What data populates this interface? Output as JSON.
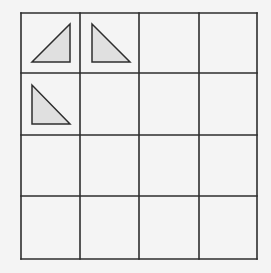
{
  "diagram": {
    "type": "grid-puzzle",
    "rows": 4,
    "cols": 4,
    "grid": {
      "x_lines": [
        21,
        80,
        139,
        199,
        257
      ],
      "y_lines": [
        13,
        73,
        135,
        196,
        259
      ],
      "line_color": "#2e2e2e",
      "line_width": 1.6
    },
    "background_color": "#f4f4f4",
    "shapes": [
      {
        "kind": "right-triangle",
        "cell": {
          "row": 0,
          "col": 0
        },
        "right_angle": "bottom-right",
        "points": [
          [
            70,
            24
          ],
          [
            32,
            62
          ],
          [
            70,
            62
          ]
        ],
        "fill": "#e0e0e0",
        "stroke": "#2e2e2e"
      },
      {
        "kind": "right-triangle",
        "cell": {
          "row": 0,
          "col": 1
        },
        "right_angle": "bottom-left",
        "points": [
          [
            92,
            24
          ],
          [
            92,
            62
          ],
          [
            130,
            62
          ]
        ],
        "fill": "#e0e0e0",
        "stroke": "#2e2e2e"
      },
      {
        "kind": "right-triangle",
        "cell": {
          "row": 1,
          "col": 0
        },
        "right_angle": "bottom-left",
        "points": [
          [
            32,
            85
          ],
          [
            32,
            124
          ],
          [
            70,
            124
          ]
        ],
        "fill": "#e0e0e0",
        "stroke": "#2e2e2e"
      }
    ]
  }
}
